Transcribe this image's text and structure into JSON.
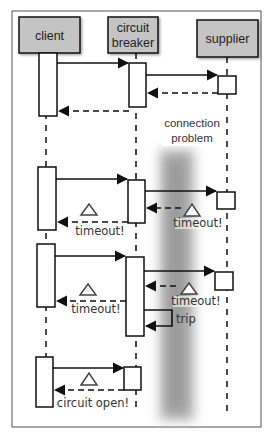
{
  "diagram": {
    "type": "sequence-diagram",
    "participants": [
      {
        "id": "client",
        "label": "client"
      },
      {
        "id": "breaker",
        "label_line1": "circuit",
        "label_line2": "breaker"
      },
      {
        "id": "supplier",
        "label": "supplier"
      }
    ],
    "notes": {
      "connection_problem_line1": "connection",
      "connection_problem_line2": "problem"
    },
    "scenarios": [
      {
        "name": "normal-call",
        "messages": [
          "client->breaker",
          "breaker->supplier",
          "supplier-->breaker",
          "breaker-->client"
        ]
      },
      {
        "name": "timeout-1",
        "supplier_label": "timeout!",
        "client_label": "timeout!"
      },
      {
        "name": "timeout-2",
        "supplier_label": "timeout!",
        "client_label": "timeout!",
        "self_call_label": "trip"
      },
      {
        "name": "circuit-open",
        "client_label": "circuit open!"
      }
    ],
    "colors": {
      "header_fill": "#c4c4c4",
      "line": "#111111",
      "frame": "#555555",
      "blur_band": "#9a9a9a"
    }
  }
}
